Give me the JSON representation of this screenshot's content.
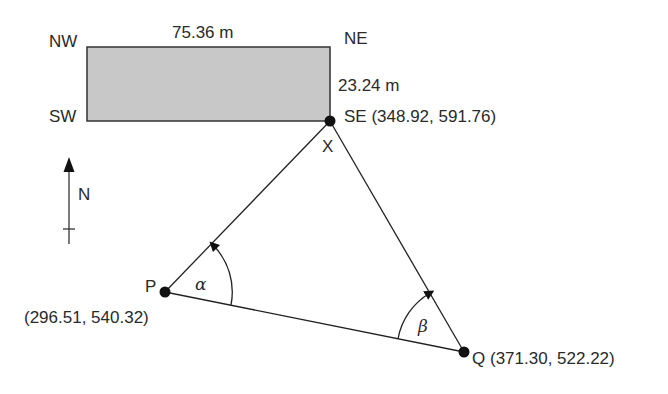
{
  "diagram": {
    "type": "survey-traverse",
    "building": {
      "corners": {
        "nw": "NW",
        "ne": "NE",
        "sw": "SW",
        "se": "SE"
      },
      "width_label": "75.36 m",
      "height_label": "23.24 m",
      "fill_color": "#c8c8c8"
    },
    "points": {
      "se": {
        "name": "SE",
        "coords": "(348.92, 591.76)"
      },
      "x": {
        "name": "X"
      },
      "p": {
        "name": "P",
        "coords": "(296.51, 540.32)"
      },
      "q": {
        "name": "Q",
        "coords": "(371.30, 522.22)"
      }
    },
    "angles": {
      "alpha": "α",
      "beta": "β"
    },
    "north_arrow": {
      "label": "N"
    }
  }
}
